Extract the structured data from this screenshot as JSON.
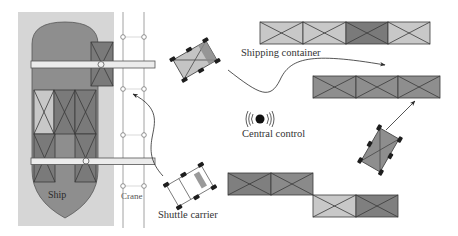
{
  "diagram": {
    "title": "",
    "labels": {
      "ship": "Ship",
      "crane": "Crane",
      "shipping_container": "Shipping container",
      "central_control": "Central control",
      "shuttle_carrier": "Shuttle carrier"
    },
    "colors": {
      "quay_background": "#d6d6d6",
      "ship_hull": "#8e8e8e",
      "container_light": "#c8c8c8",
      "container_medium": "#8e8e8e",
      "container_dark": "#7a7a7a",
      "crane_beam": "#ececec",
      "stroke": "#3a3a3a",
      "wheel": "#1e1e1e"
    },
    "ship_containers": [
      {
        "row": 1,
        "col": 1,
        "shade": "light"
      },
      {
        "row": 1,
        "col": 2,
        "shade": "dark"
      },
      {
        "row": 1,
        "col": 3,
        "shade": "dark"
      },
      {
        "row": 2,
        "col": 1,
        "shade": "dark"
      },
      {
        "row": 2,
        "col": 3,
        "shade": "dark"
      }
    ],
    "yard_rows": [
      {
        "name": "top-row",
        "containers": [
          "light",
          "light",
          "dark",
          "light"
        ]
      },
      {
        "name": "middle-row",
        "containers": [
          "medium",
          "medium",
          "medium"
        ]
      },
      {
        "name": "bottom-row-left",
        "containers": [
          "medium",
          "medium"
        ]
      },
      {
        "name": "bottom-row-right",
        "containers": [
          "light",
          "dark"
        ]
      }
    ],
    "vehicles": [
      {
        "name": "shuttle-carrier-loaded-top",
        "state": "loaded"
      },
      {
        "name": "shuttle-carrier-empty",
        "state": "empty"
      },
      {
        "name": "shuttle-carrier-loaded-right",
        "state": "loaded"
      }
    ],
    "arrows": [
      {
        "from": "shuttle-carrier-empty",
        "to": "crane"
      },
      {
        "from": "shuttle-carrier-loaded-top",
        "to": "middle-row"
      },
      {
        "from": "shuttle-carrier-loaded-right",
        "to": "middle-row"
      }
    ]
  }
}
